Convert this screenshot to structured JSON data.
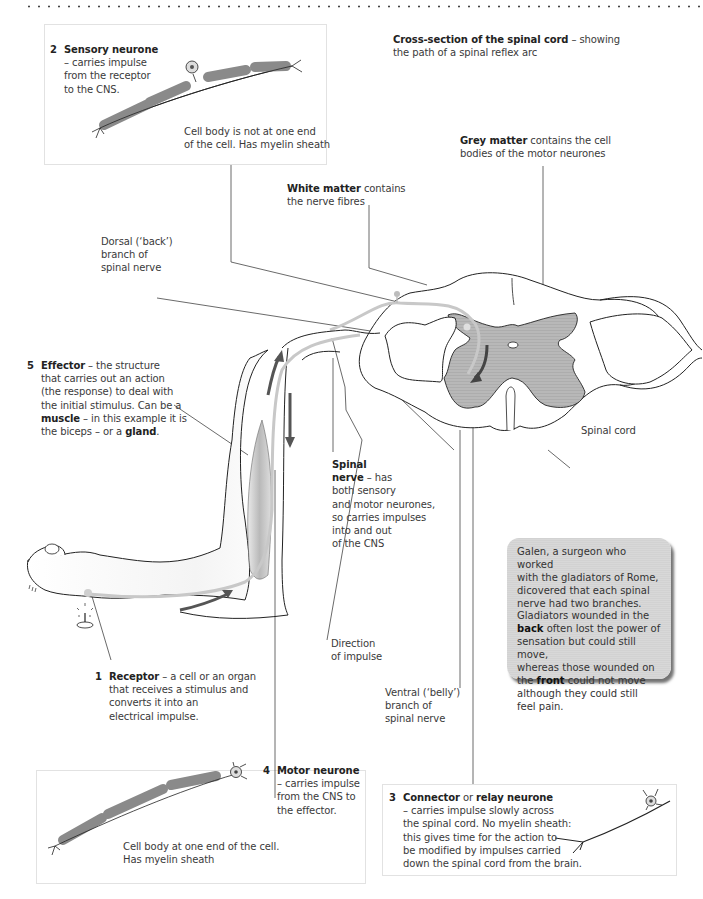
{
  "title": {
    "bold": "Cross-section of the spinal cord",
    "rest": " – showing",
    "line2": "the path of a spinal reflex arc"
  },
  "sensory_neurone": {
    "number": "2",
    "name": "Sensory neurone",
    "desc": [
      "– carries impulse",
      "from the receptor",
      "to the CNS."
    ],
    "note": [
      "Cell body is not at one end",
      "of the cell. Has myelin sheath"
    ]
  },
  "grey_matter": {
    "bold": "Grey matter",
    "rest": "  contains the cell",
    "line2": "bodies of the motor neurones"
  },
  "white_matter": {
    "bold": "White matter",
    "rest": " contains",
    "line2": "the nerve fibres"
  },
  "dorsal_branch": {
    "lines": [
      "Dorsal (‘back’)",
      "branch of",
      "spinal nerve"
    ]
  },
  "effector": {
    "number": "5",
    "name": "Effector",
    "line1_rest": " – the structure",
    "line2": "that carries out an action",
    "line3": "(the response) to deal with",
    "line4": "the initial stimulus. Can be a",
    "muscle": "muscle",
    "line5_rest": " – in this example it is",
    "line6_start": "the biceps – or a ",
    "gland": "gland",
    "line6_end": "."
  },
  "spinal_cord_label": "Spinal cord",
  "spinal_nerve": {
    "bold1": "Spinal",
    "bold2": "nerve",
    "rest2": " – has",
    "lines": [
      "both sensory",
      "and motor neurones,",
      "so carries impulses",
      "into and out",
      "of the CNS"
    ]
  },
  "direction": {
    "lines": [
      "Direction",
      "of impulse"
    ]
  },
  "ventral_branch": {
    "lines": [
      "Ventral (‘belly’)",
      "branch of",
      "spinal nerve"
    ]
  },
  "receptor": {
    "number": "1",
    "name": "Receptor",
    "line1_rest": " – a cell or an organ",
    "lines": [
      "that receives a stimulus and",
      "converts it into an",
      "electrical impulse."
    ]
  },
  "galen": {
    "lines_before": [
      "Galen, a surgeon who worked",
      "with the gladiators of Rome,",
      "dicovered that each spinal",
      "nerve had two branches.",
      "Gladiators wounded in the"
    ],
    "back": "back",
    "back_rest": " often lost the power of",
    "mid": [
      "sensation but could still move,",
      "whereas those wounded on"
    ],
    "front_pre": "the ",
    "front": "front",
    "front_rest": " could not move",
    "end": [
      "although they could still",
      "feel pain."
    ]
  },
  "motor_neurone": {
    "number": "4",
    "name": "Motor neurone",
    "desc": [
      "– carries impulse",
      "from the CNS to",
      "the effector."
    ],
    "note": [
      "Cell body at one end of the cell.",
      "Has myelin sheath"
    ]
  },
  "relay_neurone": {
    "number": "3",
    "name1": "Connector",
    "or": " or ",
    "name2": "relay neurone",
    "lines": [
      "– carries impulse slowly across",
      "the spinal cord. No myelin sheath:",
      "this gives time for the action to",
      "be modified by impulses carried",
      "down the spinal cord from the brain."
    ]
  },
  "colors": {
    "myelin": "#8a8a8a",
    "grey_matter": "#b4b4b4",
    "nerve_path": "#c8c8c8",
    "arrow": "#555555",
    "galen_box": "#d5d5d5"
  }
}
